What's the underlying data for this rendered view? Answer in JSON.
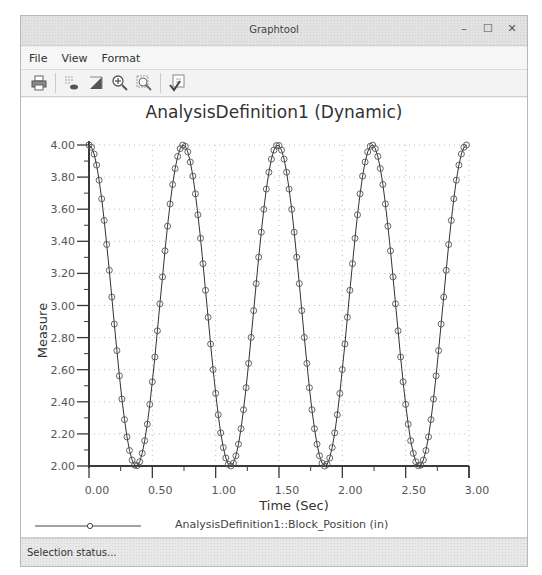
{
  "window": {
    "title": "Graphtool",
    "controls": {
      "minimize": "–",
      "maximize": "☐",
      "close": "✕"
    }
  },
  "menu": {
    "items": [
      {
        "label": "File",
        "mnemonic": "F"
      },
      {
        "label": "View",
        "mnemonic": "V"
      },
      {
        "label": "Format",
        "mnemonic": "r"
      }
    ]
  },
  "toolbar": {
    "buttons": [
      {
        "name": "print-icon"
      },
      {
        "name": "show-points-icon"
      },
      {
        "name": "fill-icon"
      },
      {
        "name": "zoom-in-icon"
      },
      {
        "name": "zoom-fit-icon"
      },
      {
        "name": "apply-icon"
      }
    ]
  },
  "status": {
    "text": "Selection status..."
  },
  "colors": {
    "line": "#333333",
    "marker": "#555555",
    "axis": "#3a3a3a",
    "grid": "#bdbdbd"
  },
  "chart_data": {
    "type": "line",
    "title": "AnalysisDefinition1 (Dynamic)",
    "xlabel": "Time (Sec)",
    "ylabel": "Measure",
    "xlim": [
      0,
      3
    ],
    "ylim": [
      2,
      4
    ],
    "xticks": [
      "0.00",
      "0.50",
      "1.00",
      "1.50",
      "2.00",
      "2.50",
      "3.00"
    ],
    "yticks": [
      "2.00",
      "2.20",
      "2.40",
      "2.60",
      "2.80",
      "3.00",
      "3.20",
      "3.40",
      "3.60",
      "3.80",
      "4.00"
    ],
    "grid": true,
    "legend_position": "bottom",
    "series": [
      {
        "name": "AnalysisDefinition1::Block_Position (in)",
        "marker": "circle",
        "function": "3 + cos(2*pi*t/0.745)",
        "x_step": 0.02,
        "x": [
          0.0,
          0.1,
          0.2,
          0.3,
          0.37,
          0.45,
          0.55,
          0.65,
          0.745,
          0.85,
          0.95,
          1.05,
          1.12,
          1.2,
          1.3,
          1.4,
          1.49,
          1.6,
          1.7,
          1.8,
          1.86,
          1.95,
          2.05,
          2.15,
          2.235,
          2.35,
          2.45,
          2.55,
          2.61,
          2.7,
          2.8,
          2.9,
          2.98
        ],
        "values": [
          4.0,
          3.67,
          2.87,
          2.18,
          2.0,
          2.17,
          2.7,
          3.38,
          4.0,
          3.49,
          2.68,
          2.12,
          2.0,
          2.07,
          2.56,
          3.29,
          4.0,
          3.42,
          2.66,
          2.08,
          2.0,
          2.06,
          2.49,
          3.2,
          4.0,
          3.55,
          2.84,
          2.21,
          2.0,
          2.06,
          2.45,
          3.13,
          3.99
        ]
      }
    ]
  }
}
